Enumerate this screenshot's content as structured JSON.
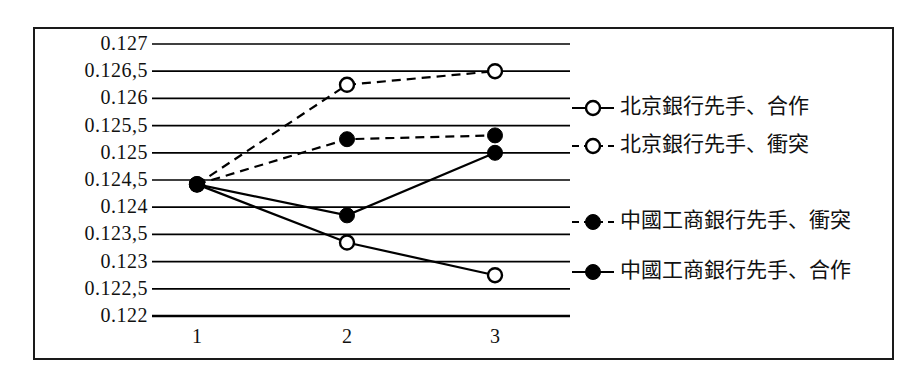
{
  "chart_data": {
    "type": "line",
    "title": "",
    "xlabel": "",
    "ylabel": "",
    "x": [
      1,
      2,
      3
    ],
    "categories": [
      "1",
      "2",
      "3"
    ],
    "xtick_labels": [
      "1",
      "2",
      "3"
    ],
    "ytick_labels": [
      "0.127",
      "0.126,5",
      "0.126",
      "0.125,5",
      "0.125",
      "0.124,5",
      "0.124",
      "0.123,5",
      "0.123",
      "0.122,5",
      "0.122"
    ],
    "ytick_values": [
      0.127,
      0.1265,
      0.126,
      0.1255,
      0.125,
      0.1245,
      0.124,
      0.1235,
      0.123,
      0.1225,
      0.122
    ],
    "ylim": [
      0.122,
      0.127
    ],
    "xlim": [
      0.6,
      3.45
    ],
    "grid": true,
    "legend_position": "right",
    "series": [
      {
        "name": "北京銀行先手、合作",
        "marker": "open-circle",
        "line": "solid",
        "values": [
          0.12442,
          0.12335,
          0.12275
        ]
      },
      {
        "name": "北京銀行先手、衝突",
        "marker": "open-circle",
        "line": "dashed",
        "values": [
          0.12442,
          0.12625,
          0.1265
        ]
      },
      {
        "name": "中國工商銀行先手、衝突",
        "marker": "filled-circle",
        "line": "dashed",
        "values": [
          0.12442,
          0.12525,
          0.12532
        ]
      },
      {
        "name": "中國工商銀行先手、合作",
        "marker": "filled-circle",
        "line": "solid",
        "values": [
          0.12442,
          0.12385,
          0.125
        ]
      }
    ],
    "colors": {
      "line": "#000000",
      "grid": "#000000",
      "frame": "#1a1a1a",
      "background": "#ffffff",
      "text": "#111111"
    }
  },
  "legend": {
    "items": [
      {
        "label": "北京銀行先手、合作",
        "marker": "open-circle",
        "line": "solid"
      },
      {
        "label": "北京銀行先手、衝突",
        "marker": "open-circle",
        "line": "dashed"
      },
      {
        "label": "中國工商銀行先手、衝突",
        "marker": "filled-circle",
        "line": "dashed"
      },
      {
        "label": "中國工商銀行先手、合作",
        "marker": "filled-circle",
        "line": "solid"
      }
    ]
  }
}
